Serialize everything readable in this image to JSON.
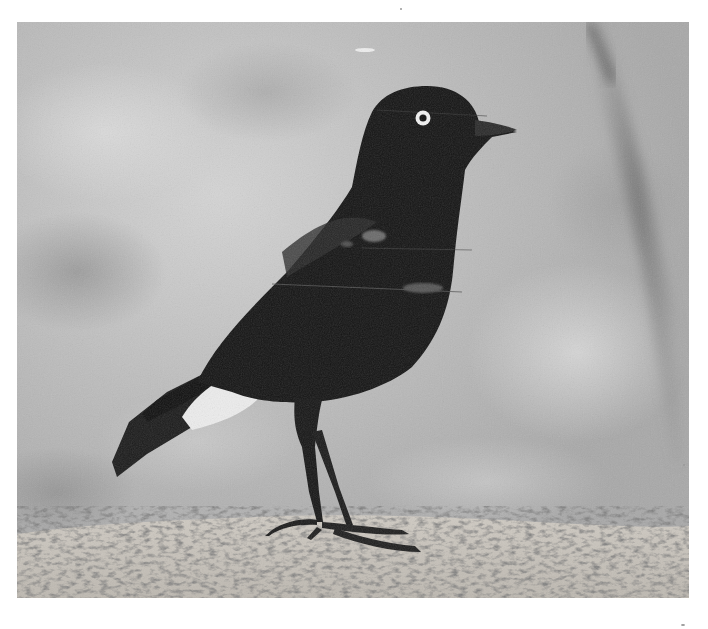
{
  "image": {
    "subject": "black bird with white eye-ring standing on rock",
    "style": "black-and-white photograph",
    "colors": {
      "page_background": "#ffffff",
      "sky_light": "#d2d2d2",
      "sky_mid": "#b6b6b6",
      "sky_dark": "#8f8f8f",
      "bird_body": "#151515",
      "bird_highlight": "#3a3a3a",
      "eye_ring": "#f2f2f2",
      "undertail_white": "#ececec",
      "rock_light": "#d9d6d0",
      "rock_dark": "#4a4a4a"
    },
    "frame": {
      "left": 17,
      "top": 22,
      "width": 672,
      "height": 576
    }
  }
}
